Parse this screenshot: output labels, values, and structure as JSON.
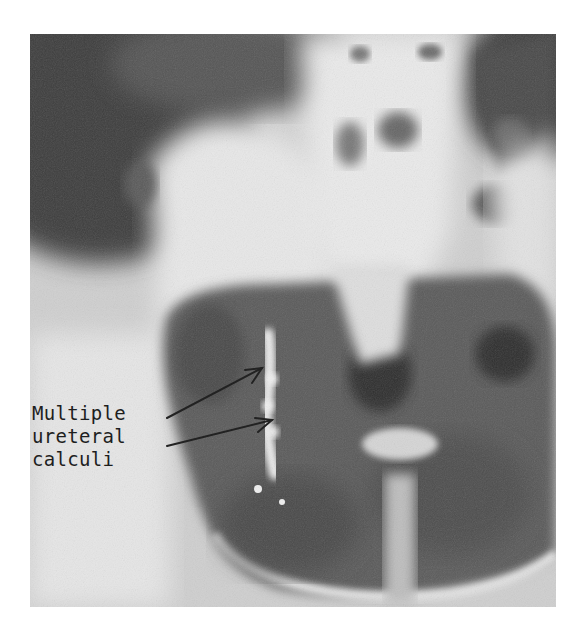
{
  "figure": {
    "type": "radiograph",
    "view": "pelvis AP",
    "annotation": {
      "lines": [
        "Multiple",
        "ureteral",
        "calculi"
      ],
      "arrow_count": 2
    },
    "colors": {
      "background": "#ffffff",
      "film_mid": "#c9c9c9",
      "film_dark": "#3a3a3a",
      "bone_light": "#ececec",
      "text": "#1e1e1e"
    }
  }
}
